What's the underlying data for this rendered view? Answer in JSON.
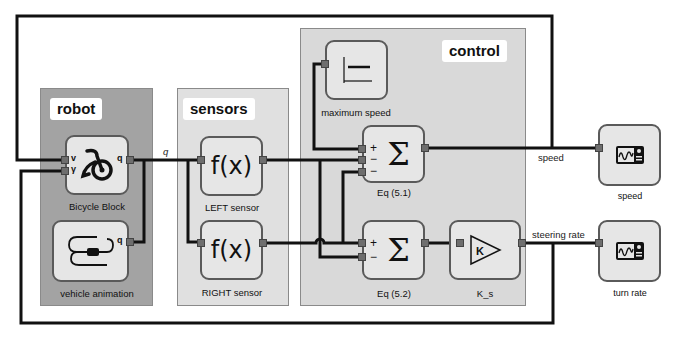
{
  "subsystems": {
    "robot": {
      "title": "robot"
    },
    "sensors": {
      "title": "sensors"
    },
    "control": {
      "title": "control"
    }
  },
  "blocks": {
    "bicycle": {
      "label": "Bicycle Block",
      "icon": "bicycle-icon",
      "ports_in": [
        "v",
        "γ"
      ],
      "ports_out": [
        "q"
      ]
    },
    "vehicle_animation": {
      "label": "vehicle animation",
      "icon": "vehicle-path-icon",
      "ports_in": [
        "q"
      ]
    },
    "left_sensor": {
      "label": "LEFT sensor",
      "glyph": "f(x)"
    },
    "right_sensor": {
      "label": "RIGHT sensor",
      "glyph": "f(x)"
    },
    "max_speed": {
      "label": "maximum speed",
      "icon": "step-constant-icon"
    },
    "eq51": {
      "label": "Eq (5.1)",
      "glyph": "Σ",
      "signs": [
        "+",
        "−",
        "−"
      ]
    },
    "eq52": {
      "label": "Eq (5.2)",
      "glyph": "Σ",
      "signs": [
        "+",
        "−"
      ]
    },
    "ks": {
      "label": "K_s",
      "glyph": "K"
    },
    "speed_scope": {
      "label": "speed",
      "icon": "scope-icon"
    },
    "turn_scope": {
      "label": "turn rate",
      "icon": "scope-icon"
    }
  },
  "wire_labels": {
    "q": "q",
    "speed": "speed",
    "steering_rate": "steering rate"
  }
}
